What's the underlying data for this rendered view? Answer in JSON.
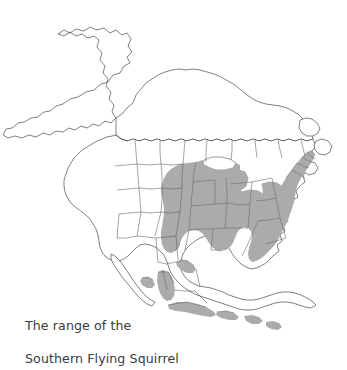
{
  "figure": {
    "kind": "range-map",
    "title_lines": [
      "The range of the",
      "Southern Flying Squirrel"
    ],
    "caption_full": "The range of the Southern Flying Squirrel",
    "subject": "Southern Flying Squirrel",
    "background_color": "#ffffff",
    "outline_color": "#4a4a4a",
    "range_fill_color": "#ababab",
    "range_outline_color": "#6b6b6b",
    "caption_color": "#3b3b3b"
  },
  "legend": {
    "shaded_meaning": "Shaded gray area indicates the species range",
    "unshaded_meaning": "White landmass outside the species range"
  },
  "regions": {
    "continent": "North America",
    "core_range": "Eastern United States",
    "disjunct_range": "Highlands of Mexico and Central America",
    "outside_range": [
      "Alaska",
      "Canada",
      "Western United States",
      "Baja California"
    ]
  }
}
